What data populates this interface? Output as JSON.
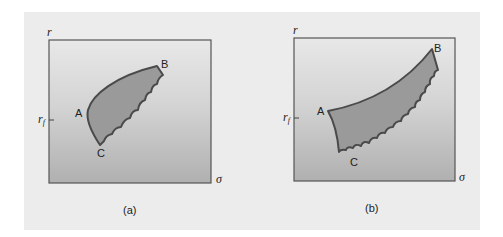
{
  "figure": {
    "panels": [
      {
        "id": "a",
        "caption": "(a)",
        "y_axis_label": "r",
        "x_axis_label": "σ",
        "tick_label": "r",
        "tick_sub": "f",
        "points": {
          "A": "A",
          "B": "B",
          "C": "C"
        }
      },
      {
        "id": "b",
        "caption": "(b)",
        "y_axis_label": "r",
        "x_axis_label": "σ",
        "tick_label": "r",
        "tick_sub": "f",
        "points": {
          "A": "A",
          "B": "B",
          "C": "C"
        }
      }
    ],
    "colors": {
      "background": "#ececec",
      "plot_fill_top": "#e6e6e6",
      "plot_fill_bottom": "#b4b4b4",
      "region_fill": "#9a9a9a",
      "outline": "#4a4a4a"
    }
  }
}
